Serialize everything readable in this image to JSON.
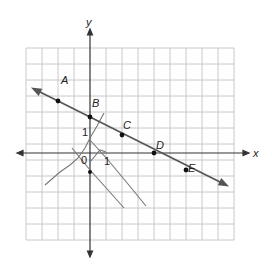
{
  "figure": {
    "axes": {
      "x_label": "x",
      "y_label": "y",
      "origin_label": "0",
      "x_unit_label": "1",
      "y_unit_label": "1"
    },
    "grid": {
      "x_min": -4,
      "x_max": 9,
      "y_min": -5.5,
      "y_max": 6.5,
      "cell_px": 16,
      "color": "#c8c8c8"
    },
    "main_line": {
      "description": "line through A, B, C, D, E with arrows on both ends",
      "slope": -0.5,
      "y_intercept": 2,
      "color": "#555555"
    },
    "points": [
      {
        "label": "A",
        "x": -2,
        "y": 3
      },
      {
        "label": "B",
        "x": 0,
        "y": 2
      },
      {
        "label": "C",
        "x": 2,
        "y": 1
      },
      {
        "label": "D",
        "x": 4,
        "y": 0
      },
      {
        "label": "E",
        "x": 6,
        "y": -1
      }
    ],
    "sketch_lines": {
      "description": "hand-drawn pencil lines near origin",
      "color": "#777777"
    }
  }
}
